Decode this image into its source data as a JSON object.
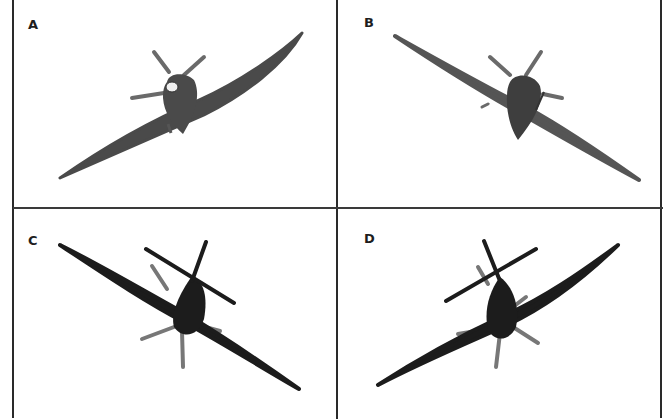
{
  "figure": {
    "panels": [
      {
        "id": "A",
        "label": "A",
        "view": "front, banked left (left wing low)",
        "fill": "#4a4a4a"
      },
      {
        "id": "B",
        "label": "B",
        "view": "front, banked right (right wing low)",
        "fill": "#555555"
      },
      {
        "id": "C",
        "label": "C",
        "view": "rear/top, banked right",
        "fill": "#1c1c1c"
      },
      {
        "id": "D",
        "label": "D",
        "view": "rear/top, banked left",
        "fill": "#1c1c1c"
      }
    ]
  }
}
